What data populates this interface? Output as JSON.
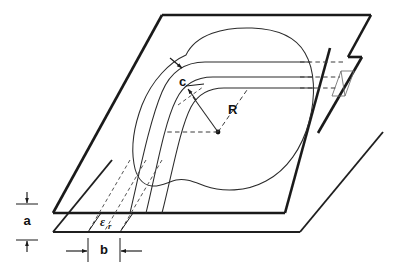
{
  "figure": {
    "domain": "technical-line-diagram",
    "background_color": "#ffffff",
    "line_color": "#1a1a1a",
    "width_px": 413,
    "height_px": 270
  },
  "labels": {
    "dimension_a": "a",
    "dimension_b": "b",
    "dimension_c": "c",
    "radius_R": "R",
    "permittivity_symbol": "ε",
    "permittivity_subscript": "r",
    "permittivity_full": "εr"
  },
  "annotations": [
    {
      "name": "plate-separation",
      "symbol": "a",
      "orientation": "vertical",
      "location": "left-edge",
      "meaning": "spacing between the two parallel ground planes"
    },
    {
      "name": "substrate-width",
      "symbol": "b",
      "orientation": "horizontal",
      "location": "bottom-left",
      "meaning": "width of the dielectric region seen edge-on"
    },
    {
      "name": "strip-width",
      "symbol": "c",
      "orientation": "leader-arrow",
      "location": "upper-left-of-bend",
      "meaning": "width of the conducting strip"
    },
    {
      "name": "bend-radius",
      "symbol": "R",
      "orientation": "radius-line",
      "location": "center-of-bend",
      "meaning": "radius of the curved strip bend measured from the centre point"
    },
    {
      "name": "relative-permittivity",
      "symbol": "εr",
      "orientation": "inline",
      "location": "bottom-left-between-plates",
      "meaning": "relative dielectric constant of the substrate"
    }
  ],
  "elements": {
    "top_plate": "upper ground plane drawn as a parallelogram with a notch cut in its right edge",
    "bottom_plate": "lower ground plane drawn as a parallelogram offset down and right",
    "blob_outline": "closed irregular curve on the top plate enclosing the strip region",
    "strip_lines": "three parallel curved lines forming the bent conducting strip",
    "projection_lines": "dashed lines projecting the strip edges to the plate notch and to the lower plate",
    "notch_detail": "small parallelogram cross-section of the strip at the plate edge"
  }
}
